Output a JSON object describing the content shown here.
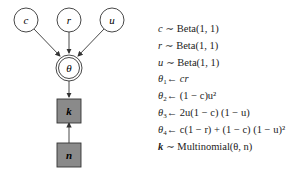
{
  "graph": {
    "nodes": [
      {
        "id": "c",
        "label": "c",
        "type": "latent"
      },
      {
        "id": "r",
        "label": "r",
        "type": "latent"
      },
      {
        "id": "u",
        "label": "u",
        "type": "latent"
      },
      {
        "id": "theta",
        "label": "θ",
        "type": "deterministic"
      },
      {
        "id": "k",
        "label": "k",
        "type": "observed"
      },
      {
        "id": "n",
        "label": "n",
        "type": "observed"
      }
    ],
    "edges": [
      {
        "from": "c",
        "to": "theta"
      },
      {
        "from": "r",
        "to": "theta"
      },
      {
        "from": "u",
        "to": "theta"
      },
      {
        "from": "theta",
        "to": "k"
      },
      {
        "from": "n",
        "to": "k"
      }
    ],
    "colors": {
      "observed_fill": "#8a8a8a",
      "stroke": "#333333"
    }
  },
  "equations": [
    {
      "lhs": "c",
      "rel": "∼",
      "rhs": "Beta(1, 1)"
    },
    {
      "lhs": "r",
      "rel": "∼",
      "rhs": "Beta(1, 1)"
    },
    {
      "lhs": "u",
      "rel": "∼",
      "rhs": "Beta(1, 1)"
    },
    {
      "lhs": "θ",
      "sub": "1",
      "rel": "←",
      "rhs": "cr"
    },
    {
      "lhs": "θ",
      "sub": "2",
      "rel": "←",
      "rhs": "(1 − c)u²"
    },
    {
      "lhs": "θ",
      "sub": "3",
      "rel": "←",
      "rhs": "2u(1 − c) (1 − u)"
    },
    {
      "lhs": "θ",
      "sub": "4",
      "rel": "←",
      "rhs": "c(1 − r) + (1 − c) (1 − u)²"
    },
    {
      "lhs": "k",
      "rel": "∼",
      "rhs": "Multinomial(θ, n)"
    }
  ]
}
